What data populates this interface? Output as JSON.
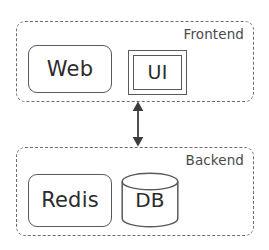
{
  "diagram": {
    "type": "architecture-block-diagram",
    "background_color": "#ffffff",
    "stroke_color": "#5a5a5a",
    "dashed_stroke_color": "#6e6e6e",
    "text_color": "#2b2b2b",
    "label_color": "#4a4a4a",
    "groups": [
      {
        "id": "frontend",
        "label": "Frontend",
        "border_style": "dashed",
        "nodes": [
          {
            "id": "web",
            "label": "Web",
            "shape": "rounded-rectangle"
          },
          {
            "id": "ui",
            "label": "UI",
            "shape": "double-rectangle"
          }
        ]
      },
      {
        "id": "backend",
        "label": "Backend",
        "border_style": "dashed",
        "nodes": [
          {
            "id": "redis",
            "label": "Redis",
            "shape": "rounded-rectangle"
          },
          {
            "id": "db",
            "label": "DB",
            "shape": "cylinder"
          }
        ]
      }
    ],
    "connectors": [
      {
        "id": "frontend-backend-link",
        "from": "frontend",
        "to": "backend",
        "label": "",
        "arrow": "double-headed",
        "orientation": "vertical"
      }
    ]
  }
}
